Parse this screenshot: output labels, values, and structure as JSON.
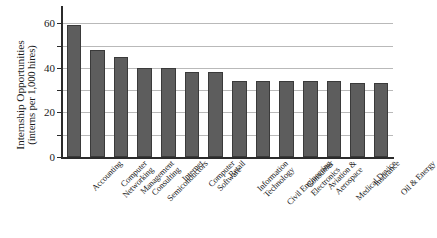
{
  "chart_data": {
    "type": "bar",
    "title": "",
    "subtitle": "",
    "xlabel": "",
    "ylabel": "Internship Opportunities (interns per 1,000 hires)",
    "ylabel_line1": "Internship Opportunities",
    "ylabel_line2": "(interns per 1,000 hires)",
    "ylim": [
      0,
      65
    ],
    "y_ticks": [
      0,
      20,
      40,
      60
    ],
    "y_tick_labels": [
      "0",
      "20",
      "40",
      "60"
    ],
    "y_minor_gridlines": [
      10,
      30,
      50
    ],
    "grid": true,
    "legend": false,
    "legend_position": "none",
    "bar_color": "#5d5d5d",
    "bar_edge_color": "#3a3a3a",
    "grid_color": "#b9b9b9",
    "axis_color": "#2b2b2b",
    "categories": [
      "Accounting",
      "Computer Networking",
      "Management Consulting",
      "Semiconductors",
      "Internet",
      "Computer Software",
      "Retail",
      "Information Technology",
      "Civil Engineering",
      "Consumer Electronics",
      "Aviation & Aerospace",
      "Medical Device",
      "Insurance",
      "Oil & Energy"
    ],
    "category_lines": [
      [
        "Accounting"
      ],
      [
        "Computer",
        "Networking"
      ],
      [
        "Management",
        "Consulting"
      ],
      [
        "Semiconductors"
      ],
      [
        "Internet"
      ],
      [
        "Computer",
        "Software"
      ],
      [
        "Retail"
      ],
      [
        "Information",
        "Technology"
      ],
      [
        "Civil Engineering"
      ],
      [
        "Consumer",
        "Electronics"
      ],
      [
        "Aviation &",
        "Aerospace"
      ],
      [
        "Medical Device"
      ],
      [
        "Insurance"
      ],
      [
        "Oil & Energy"
      ]
    ],
    "values": [
      59,
      48,
      45,
      40,
      40,
      38,
      38,
      34,
      34,
      34,
      34,
      34,
      33,
      33
    ]
  }
}
